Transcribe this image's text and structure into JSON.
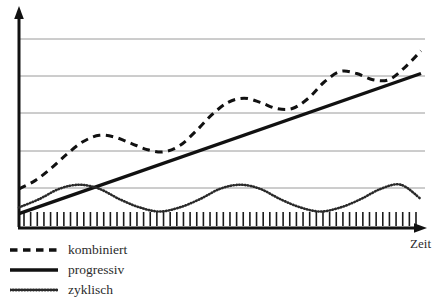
{
  "chart_data": {
    "type": "line",
    "title": "",
    "xlabel": "Zeit",
    "ylabel": "",
    "grid": true,
    "gridlines_y": [
      39,
      76,
      113,
      151,
      188
    ],
    "axis_style": "arrows",
    "x_axis_ticks": "dense-unlabeled",
    "x_tick_count": 60,
    "xlim": [
      0,
      100
    ],
    "ylim": [
      0,
      100
    ],
    "legend_position": "bottom-left",
    "series": [
      {
        "name": "kombiniert",
        "style": "dashed",
        "color": "#111111",
        "width": 3,
        "description": "progressiv ansteigende Kurve mit zyklischen Schwankungen",
        "x": [
          0,
          4,
          8,
          12,
          16,
          20,
          24,
          28,
          32,
          36,
          40,
          44,
          48,
          52,
          56,
          60,
          64,
          68,
          72,
          76,
          80,
          84,
          88,
          92,
          96,
          100
        ],
        "y": [
          19,
          23,
          29,
          36,
          42,
          45,
          44,
          41,
          38,
          37,
          40,
          47,
          55,
          61,
          63,
          61,
          58,
          58,
          63,
          71,
          76,
          75,
          72,
          72,
          78,
          86
        ]
      },
      {
        "name": "progressiv",
        "style": "solid",
        "color": "#111111",
        "width": 3.4,
        "description": "lineare Steigerung",
        "x": [
          0,
          100
        ],
        "y": [
          7,
          75
        ]
      },
      {
        "name": "zyklisch",
        "style": "dotted",
        "color": "#2a2a2a",
        "width": 2.6,
        "description": "gleichbleibende zyklische Schwankung",
        "x": [
          0,
          5,
          10,
          15,
          20,
          25,
          30,
          35,
          40,
          45,
          50,
          55,
          60,
          65,
          70,
          75,
          80,
          85,
          90,
          95,
          100
        ],
        "y": [
          10,
          14,
          19,
          21,
          19,
          14,
          10,
          8,
          10,
          14,
          19,
          21,
          19,
          14,
          10,
          8,
          10,
          14,
          19,
          21,
          14
        ]
      }
    ]
  },
  "axes": {
    "x_label": "Zeit"
  },
  "legend": {
    "items": [
      {
        "label": "kombiniert",
        "sample": "dashed-line-sample"
      },
      {
        "label": "progressiv",
        "sample": "solid-line-sample"
      },
      {
        "label": "zyklisch",
        "sample": "dotted-line-sample"
      }
    ]
  },
  "colors": {
    "line": "#111111",
    "grid": "#9a9a9a",
    "axis": "#111111",
    "background": "#ffffff",
    "text": "#2b2b2b"
  }
}
